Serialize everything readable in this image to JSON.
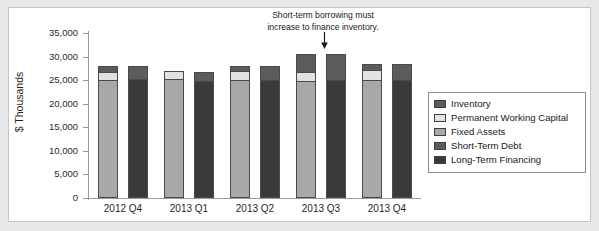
{
  "figure": {
    "ghost_caption": "",
    "background_color": "#e8e8e8",
    "panel_color": "#ffffff",
    "panel_border_color": "#c6c6c6"
  },
  "annotation": {
    "line1": "Short-term borrowing must",
    "line2": "increase to finance inventory.",
    "arrow_icon": "down-arrow-icon",
    "target_category": "2013 Q3"
  },
  "legend": {
    "position": "right",
    "items": [
      {
        "label": "Inventory",
        "color": "#5b5b5b",
        "swatch": "inventory-swatch"
      },
      {
        "label": "Permanent Working Capital",
        "color": "#e2e2e2",
        "swatch": "permanent-working-capital-swatch"
      },
      {
        "label": "Fixed Assets",
        "color": "#a8a8a8",
        "swatch": "fixed-assets-swatch"
      },
      {
        "label": "Short-Term Debt",
        "color": "#5b5b5b",
        "swatch": "short-term-debt-swatch"
      },
      {
        "label": "Long-Term Financing",
        "color": "#3a3a3a",
        "swatch": "long-term-financing-swatch"
      }
    ]
  },
  "chart_data": {
    "type": "bar",
    "subtype": "paired-stacked-column",
    "title": "",
    "xlabel": "",
    "ylabel": "$ Thousands",
    "ylim": [
      0,
      35000
    ],
    "ytick_step": 5000,
    "ytick_labels": [
      "35,000",
      "30,000",
      "25,000",
      "20,000",
      "15,000",
      "10,000",
      "5,000",
      "0"
    ],
    "ytick_values": [
      35000,
      30000,
      25000,
      20000,
      15000,
      10000,
      5000,
      0
    ],
    "grid": false,
    "categories": [
      "2012 Q4",
      "2013 Q1",
      "2013 Q2",
      "2013 Q3",
      "2013 Q4"
    ],
    "note": "Each category shows two stacked bars: left = asset side (Fixed Assets + Permanent Working Capital + Inventory), right = financing side (Long-Term Financing + Short-Term Debt).",
    "series": [
      {
        "name": "Fixed Assets",
        "side": "left",
        "color": "#a8a8a8",
        "values": [
          25000,
          25200,
          25000,
          24800,
          25000
        ]
      },
      {
        "name": "Permanent Working Capital",
        "side": "left",
        "color": "#e2e2e2",
        "values": [
          1800,
          1700,
          1900,
          1900,
          2100
        ]
      },
      {
        "name": "Inventory",
        "side": "left",
        "color": "#5b5b5b",
        "values": [
          1300,
          0,
          1200,
          3900,
          1400
        ]
      },
      {
        "name": "Long-Term Financing",
        "side": "right",
        "color": "#3a3a3a",
        "values": [
          25100,
          24900,
          25000,
          24900,
          25000
        ]
      },
      {
        "name": "Short-Term Debt",
        "side": "right",
        "color": "#5b5b5b",
        "values": [
          3000,
          1800,
          3000,
          5700,
          3500
        ]
      }
    ],
    "totals": {
      "left": [
        28100,
        26900,
        28100,
        30600,
        28500
      ],
      "right": [
        28100,
        26700,
        28000,
        30600,
        28500
      ]
    }
  }
}
